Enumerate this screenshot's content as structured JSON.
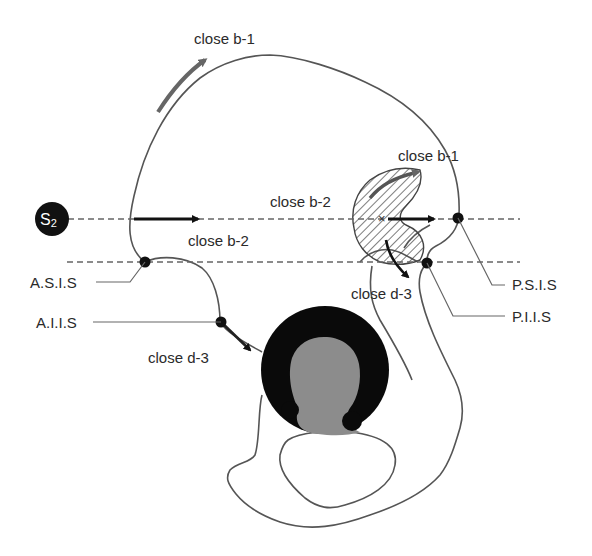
{
  "diagram": {
    "sacral_marker": {
      "label": "S",
      "subscript": "2"
    },
    "arrows": [
      {
        "id": "b1-crest",
        "label": "close b-1"
      },
      {
        "id": "b2-front",
        "label": "close b-2"
      },
      {
        "id": "b1-sacroiliac",
        "label": "close b-1"
      },
      {
        "id": "b2-sacroiliac",
        "label": "close b-2"
      },
      {
        "id": "d3-posterior",
        "label": "close d-3"
      },
      {
        "id": "d3-anterior",
        "label": "close d-3"
      }
    ],
    "landmarks": [
      {
        "id": "asis",
        "label": "A.S.I.S"
      },
      {
        "id": "aiis",
        "label": "A.I.I.S"
      },
      {
        "id": "psis",
        "label": "P.S.I.S"
      },
      {
        "id": "piis",
        "label": "P.I.I.S"
      }
    ],
    "colors": {
      "outline": "#555555",
      "arrow_dark": "#111111",
      "arrow_gray": "#666666",
      "acetabulum_rim": "#0a0a0a",
      "acetabulum_fossa": "#8c8c8c",
      "hatch": "#444444"
    }
  }
}
